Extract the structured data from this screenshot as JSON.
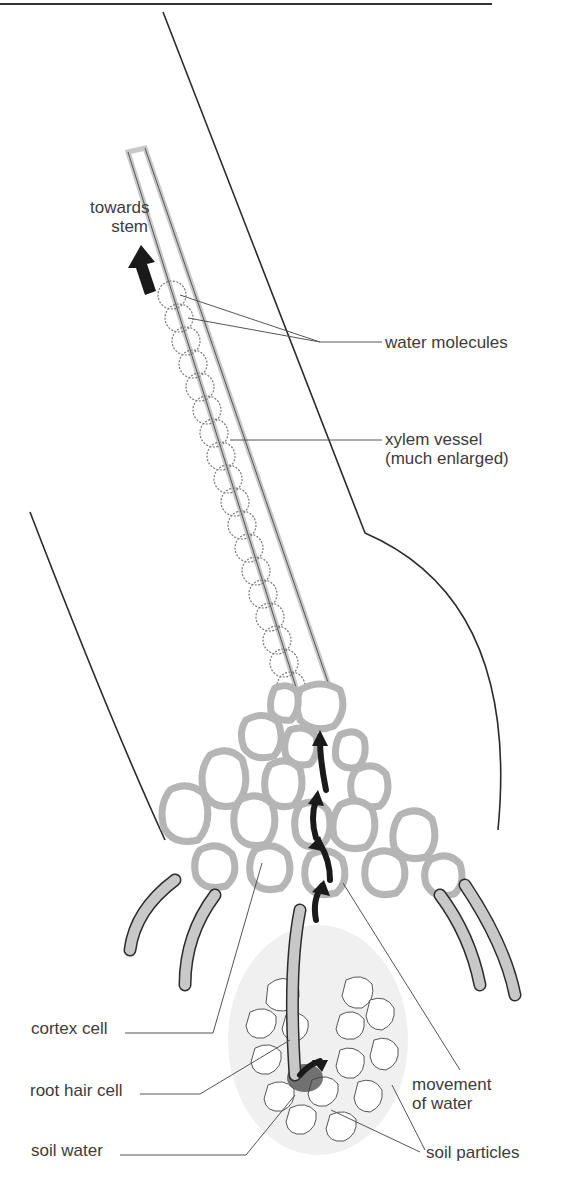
{
  "diagram": {
    "type": "biology-illustration",
    "labels": {
      "towards_stem_1": "towards",
      "towards_stem_2": "stem",
      "water_molecules": "water molecules",
      "xylem_vessel_1": "xylem vessel",
      "xylem_vessel_2": "(much enlarged)",
      "cortex_cell": "cortex cell",
      "root_hair_cell": "root hair cell",
      "soil_water": "soil water",
      "movement_of_water_1": "movement",
      "movement_of_water_2": "of water",
      "soil_particles": "soil particles"
    },
    "colors": {
      "outline": "#2b2b2b",
      "cell_wall": "#c8c8c8",
      "arrow": "#1a1a1a",
      "leader_line": "#555555"
    }
  }
}
